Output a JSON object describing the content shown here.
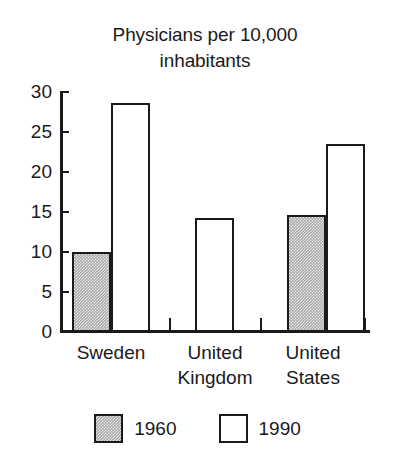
{
  "chart_data": {
    "type": "bar",
    "title": "Physicians per 10,000\ninhabitants",
    "title_line1": "Physicians per 10,000",
    "title_line2": "inhabitants",
    "xlabel": "",
    "ylabel": "",
    "ylim": [
      0,
      30
    ],
    "yticks": [
      0,
      5,
      10,
      15,
      20,
      25,
      30
    ],
    "ytick_labels": [
      "0",
      "5",
      "10",
      "15",
      "20",
      "25",
      "30"
    ],
    "grid": false,
    "legend_position": "bottom",
    "categories": [
      "Sweden",
      "United Kingdom",
      "United States"
    ],
    "category_labels": [
      "Sweden",
      "United\nKingdom",
      "United\nStates"
    ],
    "series": [
      {
        "name": "1960",
        "fill": "grey-stipple",
        "color": "#a8a8a8",
        "values": [
          9.9,
          null,
          14.5
        ]
      },
      {
        "name": "1990",
        "fill": "white",
        "color": "#ffffff",
        "values": [
          28.5,
          14.1,
          23.4
        ]
      }
    ],
    "outline_color": "#1a1a1a"
  },
  "axis": {
    "ticks": [
      {
        "label": "30",
        "top": 82
      },
      {
        "label": "25",
        "top": 122
      },
      {
        "label": "20",
        "top": 162
      },
      {
        "label": "15",
        "top": 202
      },
      {
        "label": "10",
        "top": 242
      },
      {
        "label": "5",
        "top": 282
      },
      {
        "label": "0",
        "top": 322
      }
    ]
  },
  "legend": {
    "items": [
      {
        "label": "1960",
        "series": "series-1960"
      },
      {
        "label": "1990",
        "series": "series-1990"
      }
    ]
  },
  "bars": [
    {
      "name": "bar-sweden-1960",
      "series": "series-1960",
      "left": 72,
      "top": 252,
      "width": 39,
      "height": 80
    },
    {
      "name": "bar-sweden-1990",
      "series": "series-1990",
      "left": 111,
      "top": 103,
      "width": 39,
      "height": 229
    },
    {
      "name": "bar-united-kingdom-1990",
      "series": "series-1990",
      "left": 195,
      "top": 218,
      "width": 39,
      "height": 114
    },
    {
      "name": "bar-united-states-1960",
      "series": "series-1960",
      "left": 287,
      "top": 215,
      "width": 39,
      "height": 117
    },
    {
      "name": "bar-united-states-1990",
      "series": "series-1990",
      "left": 326,
      "top": 144,
      "width": 39,
      "height": 188
    }
  ],
  "xticks": [
    {
      "left": 169
    },
    {
      "left": 260
    },
    {
      "left": 364
    }
  ],
  "category_positions": [
    {
      "name": "Sweden",
      "left": 51,
      "width": 120
    },
    {
      "name": "United Kingdom",
      "left": 155,
      "width": 120
    },
    {
      "name": "United States",
      "left": 253,
      "width": 120
    }
  ]
}
